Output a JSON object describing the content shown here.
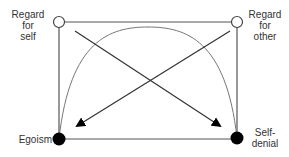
{
  "diagram": {
    "nodes": {
      "top_left": {
        "label_lines": [
          "Regard",
          "for",
          "self"
        ],
        "style": "open-circle"
      },
      "top_right": {
        "label_lines": [
          "Regard",
          "for",
          "other"
        ],
        "style": "open-circle"
      },
      "bottom_left": {
        "label": "Egoism",
        "style": "filled-circle"
      },
      "bottom_right": {
        "label_lines": [
          "Self-",
          "denial"
        ],
        "style": "filled-circle"
      }
    },
    "edges": [
      {
        "from": "top_left",
        "to": "top_right",
        "type": "line"
      },
      {
        "from": "top_left",
        "to": "bottom_left",
        "type": "line"
      },
      {
        "from": "top_right",
        "to": "bottom_right",
        "type": "line"
      },
      {
        "from": "bottom_left",
        "to": "bottom_right",
        "type": "line"
      },
      {
        "from": "top_left",
        "to": "bottom_right",
        "type": "arrow"
      },
      {
        "from": "top_right",
        "to": "bottom_left",
        "type": "arrow"
      },
      {
        "from": "bottom_left",
        "to": "bottom_right",
        "type": "arc"
      }
    ],
    "colors": {
      "line": "#444444",
      "fill": "#000000",
      "arc": "#777777"
    }
  }
}
